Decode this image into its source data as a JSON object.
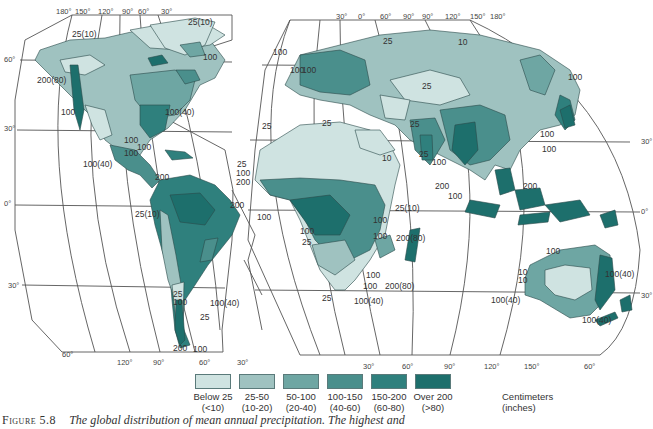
{
  "figure": {
    "number": "Figure 5.8",
    "caption": "The global distribution of mean annual precipitation. The highest and"
  },
  "map": {
    "title": "Global distribution of mean annual precipitation",
    "colors": {
      "below25": "#cfe3e1",
      "25_50": "#9fc2c0",
      "50_100": "#6ea6a3",
      "100_150": "#4a8f8c",
      "150_200": "#2f807d",
      "over200": "#1d6f6c",
      "ocean": "#ffffff",
      "grid": "#555555"
    },
    "degree_labels": {
      "west_top": [
        "180°",
        "150°",
        "120°",
        "90°",
        "60°",
        "30°"
      ],
      "east_top": [
        "30°",
        "0°",
        "60°",
        "90°",
        "90°",
        "120°",
        "150°",
        "180°"
      ],
      "west_left": [
        "60°",
        "30°",
        "0°",
        "30°",
        "60°"
      ],
      "east_right": [
        "30°",
        "0°",
        "30°",
        "60°"
      ],
      "west_bottom": [
        "120°",
        "90°",
        "60°",
        "30°"
      ],
      "east_bottom": [
        "30°",
        "60°",
        "90°",
        "120°",
        "150°"
      ]
    },
    "isohyet_labels": [
      "25(10)",
      "25(10)",
      "100",
      "200(80)",
      "100",
      "100(40)",
      "100",
      "100",
      "100",
      "100(40)",
      "200",
      "25(10)",
      "25",
      "100",
      "200",
      "200",
      "100",
      "25",
      "100",
      "100(40)",
      "25",
      "200",
      "100",
      "100",
      "100",
      "25",
      "10",
      "100",
      "100",
      "25",
      "25",
      "25",
      "25",
      "10",
      "25",
      "100",
      "200",
      "100",
      "200",
      "100",
      "25(10)",
      "100",
      "25",
      "100",
      "100",
      "200(80)",
      "100",
      "100",
      "200(80)",
      "25",
      "100(40)",
      "100",
      "10",
      "10",
      "100(40)",
      "100(40)",
      "100(40)",
      "100"
    ]
  },
  "legend": {
    "items": [
      {
        "range": "Below 25",
        "inches": "(<10)"
      },
      {
        "range": "25-50",
        "inches": "(10-20)"
      },
      {
        "range": "50-100",
        "inches": "(20-40)"
      },
      {
        "range": "100-150",
        "inches": "(40-60)"
      },
      {
        "range": "150-200",
        "inches": "(60-80)"
      },
      {
        "range": "Over 200",
        "inches": "(>80)"
      }
    ],
    "unit_primary": "Centimeters",
    "unit_secondary": "(inches)"
  }
}
